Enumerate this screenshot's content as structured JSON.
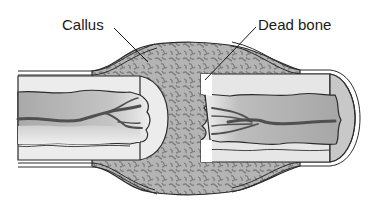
{
  "diagram": {
    "labels": [
      {
        "id": "callus",
        "text": "Callus"
      },
      {
        "id": "dead-bone",
        "text": "Dead bone"
      }
    ],
    "colors": {
      "outline": "#2a2a2a",
      "callus_fill": "#a8a8a8",
      "callus_pattern": "#7a7a7a",
      "cortex_fill": "#e8e8e8",
      "marrow_fill": "#b5b5b5",
      "marrow_light": "#d9d9d9",
      "vessel": "#555555",
      "periosteum": "#ffffff",
      "background": "#ffffff"
    }
  }
}
